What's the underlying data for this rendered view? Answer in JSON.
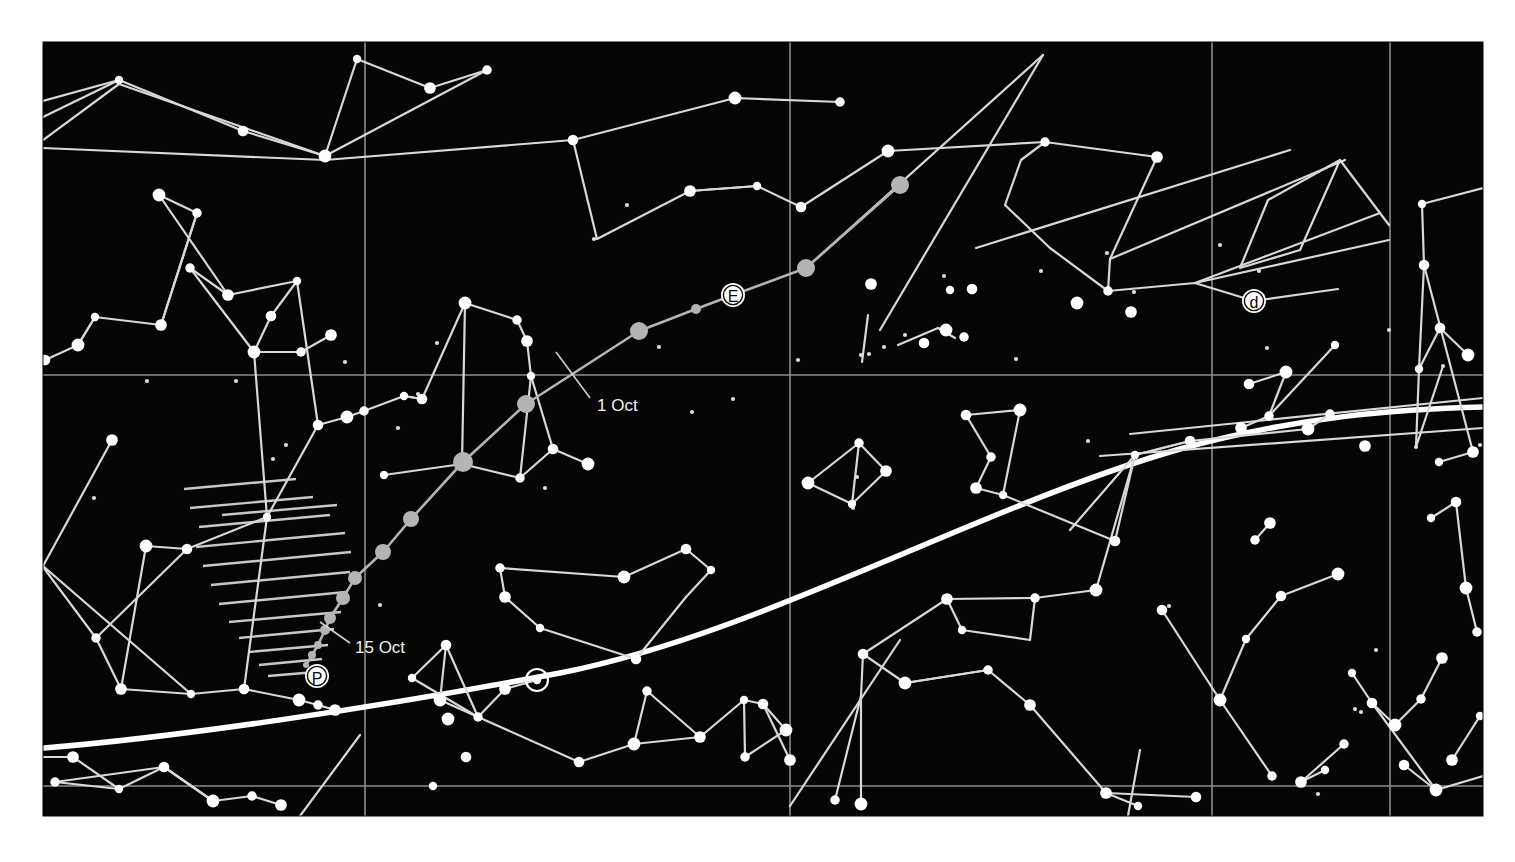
{
  "chart_data": {
    "type": "scatter",
    "subtitle": "",
    "xlabel": "",
    "ylabel": "",
    "grid": true,
    "legend_position": "none",
    "background_color": "#050505",
    "page_color": "#ffffff",
    "star_color": "#ffffff",
    "faint_star_color": "#a8a8a8",
    "line_color": "#d8d8d8",
    "grid_color": "#909090",
    "ecliptic_color": "#ffffff",
    "plot_area": {
      "x": 43,
      "y": 42,
      "width": 1440,
      "height": 774
    },
    "grid_lines": {
      "vertical_x": [
        365,
        790,
        1212,
        1390
      ],
      "horizontal_y": [
        375,
        786
      ]
    },
    "annotations": [
      {
        "name": "date-label-1-oct",
        "text": "1 Oct",
        "x": 597,
        "y": 411,
        "leader_from": [
          590,
          398
        ],
        "leader_to": [
          556,
          352
        ]
      },
      {
        "name": "date-label-15-oct",
        "text": "15 Oct",
        "x": 355,
        "y": 653,
        "leader_from": [
          350,
          643
        ],
        "leader_to": [
          320,
          622
        ]
      }
    ],
    "markers": [
      {
        "name": "marker-E",
        "label": "E",
        "cx": 733,
        "cy": 295,
        "r": 12
      },
      {
        "name": "marker-d",
        "label": "d",
        "cx": 1254,
        "cy": 301,
        "r": 12
      },
      {
        "name": "marker-P",
        "label": "P",
        "cx": 317,
        "cy": 676,
        "r": 12
      },
      {
        "name": "marker-sun",
        "label": "⊙",
        "cx": 537,
        "cy": 680,
        "r": 11
      }
    ],
    "planet_track": {
      "name": "planet-path",
      "color": "#b4b4b4",
      "points": [
        [
          900,
          185
        ],
        [
          806,
          268
        ],
        [
          733,
          295
        ],
        [
          696,
          309
        ],
        [
          639,
          331
        ],
        [
          526,
          404
        ],
        [
          463,
          462
        ],
        [
          411,
          519
        ],
        [
          383,
          552
        ],
        [
          355,
          578
        ],
        [
          343,
          598
        ],
        [
          330,
          618
        ],
        [
          325,
          630
        ],
        [
          318,
          645
        ],
        [
          312,
          655
        ],
        [
          306,
          665
        ]
      ],
      "dot_radii": [
        9,
        9,
        8,
        5,
        9,
        9,
        10,
        8,
        8,
        7,
        7,
        6,
        5,
        4,
        4,
        3
      ]
    },
    "ecliptic": {
      "name": "ecliptic-line",
      "description": "Broad white curve of the ecliptic",
      "path": "M 44,748 C 180,735 380,705 560,672 C 760,636 980,510 1180,450 C 1300,418 1400,410 1483,408"
    },
    "hatched_region": {
      "name": "hatched-zone",
      "description": "Hatched triangular area of horizon obstruction near P",
      "line_count": 13
    },
    "stars_bright": [
      [
        119,
        80
      ],
      [
        243,
        131
      ],
      [
        325,
        156
      ],
      [
        487,
        70
      ],
      [
        430,
        88
      ],
      [
        357,
        59
      ],
      [
        573,
        140
      ],
      [
        735,
        98
      ],
      [
        840,
        102
      ],
      [
        690,
        191
      ],
      [
        757,
        186
      ],
      [
        801,
        207
      ],
      [
        888,
        151
      ],
      [
        1045,
        142
      ],
      [
        1157,
        157
      ],
      [
        1422,
        204
      ],
      [
        1424,
        265
      ],
      [
        159,
        195
      ],
      [
        197,
        213
      ],
      [
        161,
        325
      ],
      [
        95,
        317
      ],
      [
        45,
        360
      ],
      [
        78,
        345
      ],
      [
        190,
        268
      ],
      [
        228,
        295
      ],
      [
        297,
        281
      ],
      [
        271,
        316
      ],
      [
        254,
        352
      ],
      [
        301,
        352
      ],
      [
        331,
        335
      ],
      [
        404,
        396
      ],
      [
        422,
        399
      ],
      [
        465,
        303
      ],
      [
        517,
        320
      ],
      [
        527,
        341
      ],
      [
        531,
        376
      ],
      [
        553,
        449
      ],
      [
        588,
        464
      ],
      [
        520,
        478
      ],
      [
        462,
        464
      ],
      [
        384,
        475
      ],
      [
        318,
        425
      ],
      [
        347,
        417
      ],
      [
        364,
        411
      ],
      [
        112,
        440
      ],
      [
        267,
        517
      ],
      [
        187,
        549
      ],
      [
        146,
        546
      ],
      [
        96,
        638
      ],
      [
        121,
        689
      ],
      [
        191,
        694
      ],
      [
        244,
        689
      ],
      [
        299,
        700
      ],
      [
        318,
        705
      ],
      [
        335,
        710
      ],
      [
        412,
        678
      ],
      [
        446,
        645
      ],
      [
        440,
        700
      ],
      [
        478,
        717
      ],
      [
        505,
        689
      ],
      [
        537,
        680
      ],
      [
        579,
        762
      ],
      [
        634,
        744
      ],
      [
        647,
        691
      ],
      [
        700,
        737
      ],
      [
        744,
        700
      ],
      [
        763,
        704
      ],
      [
        786,
        730
      ],
      [
        745,
        757
      ],
      [
        790,
        760
      ],
      [
        711,
        570
      ],
      [
        686,
        549
      ],
      [
        624,
        577
      ],
      [
        500,
        568
      ],
      [
        505,
        597
      ],
      [
        540,
        628
      ],
      [
        636,
        659
      ],
      [
        808,
        483
      ],
      [
        859,
        443
      ],
      [
        886,
        471
      ],
      [
        852,
        504
      ],
      [
        966,
        415
      ],
      [
        1020,
        410
      ],
      [
        991,
        457
      ],
      [
        976,
        488
      ],
      [
        1003,
        495
      ],
      [
        1115,
        541
      ],
      [
        1096,
        590
      ],
      [
        1035,
        598
      ],
      [
        947,
        599
      ],
      [
        962,
        630
      ],
      [
        863,
        654
      ],
      [
        905,
        683
      ],
      [
        988,
        670
      ],
      [
        1030,
        705
      ],
      [
        1135,
        455
      ],
      [
        1190,
        441
      ],
      [
        1308,
        429
      ],
      [
        1330,
        414
      ],
      [
        1365,
        446
      ],
      [
        1246,
        639
      ],
      [
        1281,
        596
      ],
      [
        1338,
        574
      ],
      [
        1255,
        540
      ],
      [
        1270,
        523
      ],
      [
        1352,
        673
      ],
      [
        1372,
        703
      ],
      [
        1395,
        725
      ],
      [
        1421,
        699
      ],
      [
        1442,
        658
      ],
      [
        1431,
        518
      ],
      [
        1456,
        502
      ],
      [
        1466,
        588
      ],
      [
        1477,
        632
      ],
      [
        1452,
        760
      ],
      [
        1480,
        716
      ],
      [
        1404,
        765
      ],
      [
        1436,
        790
      ],
      [
        1344,
        744
      ],
      [
        1301,
        782
      ],
      [
        1325,
        770
      ],
      [
        1162,
        610
      ],
      [
        1220,
        700
      ],
      [
        1272,
        776
      ],
      [
        1106,
        793
      ],
      [
        1138,
        806
      ],
      [
        1196,
        797
      ],
      [
        861,
        804
      ],
      [
        835,
        800
      ],
      [
        1473,
        452
      ],
      [
        1439,
        462
      ],
      [
        1249,
        384
      ],
      [
        1286,
        372
      ],
      [
        1269,
        416
      ],
      [
        1241,
        428
      ],
      [
        1335,
        345
      ],
      [
        924,
        343
      ],
      [
        946,
        330
      ],
      [
        964,
        337
      ],
      [
        871,
        284
      ],
      [
        950,
        290
      ],
      [
        972,
        289
      ],
      [
        1077,
        303
      ],
      [
        1108,
        291
      ],
      [
        1131,
        312
      ],
      [
        1419,
        369
      ],
      [
        1440,
        328
      ],
      [
        1468,
        355
      ],
      [
        55,
        782
      ],
      [
        73,
        757
      ],
      [
        119,
        789
      ],
      [
        164,
        767
      ],
      [
        213,
        801
      ],
      [
        252,
        796
      ],
      [
        281,
        805
      ],
      [
        433,
        786
      ],
      [
        466,
        757
      ],
      [
        448,
        719
      ]
    ],
    "stars_faint": [
      [
        639,
        331
      ],
      [
        806,
        268
      ],
      [
        900,
        185
      ],
      [
        976,
        248
      ],
      [
        1110,
        259
      ],
      [
        1195,
        283
      ],
      [
        526,
        404
      ],
      [
        463,
        462
      ],
      [
        411,
        519
      ],
      [
        383,
        552
      ],
      [
        355,
        578
      ],
      [
        343,
        598
      ],
      [
        330,
        618
      ],
      [
        322,
        634
      ]
    ],
    "tiny_stars": [
      [
        94,
        498
      ],
      [
        113,
        438
      ],
      [
        147,
        381
      ],
      [
        236,
        381
      ],
      [
        273,
        459
      ],
      [
        286,
        445
      ],
      [
        345,
        362
      ],
      [
        380,
        605
      ],
      [
        398,
        428
      ],
      [
        418,
        394
      ],
      [
        437,
        343
      ],
      [
        545,
        488
      ],
      [
        594,
        239
      ],
      [
        627,
        205
      ],
      [
        659,
        347
      ],
      [
        692,
        412
      ],
      [
        733,
        399
      ],
      [
        798,
        360
      ],
      [
        853,
        508
      ],
      [
        869,
        354
      ],
      [
        884,
        347
      ],
      [
        905,
        335
      ],
      [
        944,
        276
      ],
      [
        971,
        288
      ],
      [
        1041,
        271
      ],
      [
        1107,
        253
      ],
      [
        1134,
        292
      ],
      [
        1169,
        606
      ],
      [
        1220,
        245
      ],
      [
        1267,
        348
      ],
      [
        1334,
        347
      ],
      [
        1361,
        712
      ],
      [
        1389,
        330
      ],
      [
        1416,
        447
      ],
      [
        1443,
        366
      ],
      [
        1480,
        445
      ],
      [
        1259,
        271
      ],
      [
        1088,
        441
      ],
      [
        1016,
        359
      ],
      [
        857,
        477
      ],
      [
        861,
        355
      ],
      [
        1355,
        709
      ],
      [
        1318,
        794
      ],
      [
        1376,
        650
      ]
    ]
  }
}
